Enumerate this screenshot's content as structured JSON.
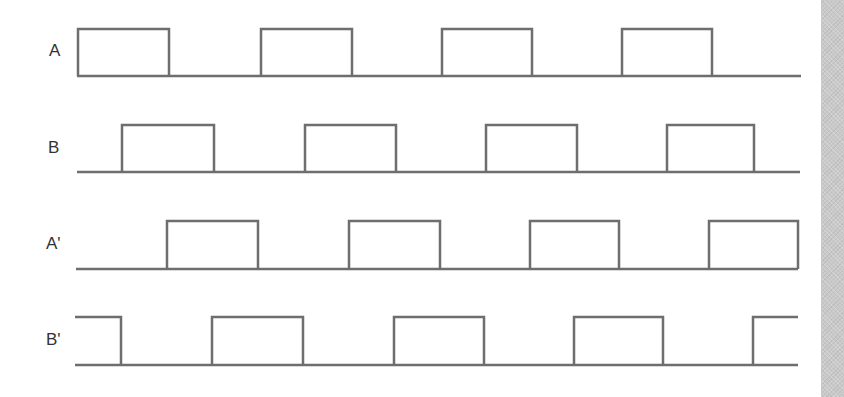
{
  "diagram": {
    "type": "timing-diagram",
    "stroke_color": "#6e6e6e",
    "stroke_width": 2.5,
    "background": "#ffffff",
    "side_bar_color": "#c9c9c9",
    "signals": [
      {
        "label": "A",
        "label_pos": [
          49,
          42
        ],
        "high_y": 29,
        "low_y": 76,
        "baseline": [
          77,
          801
        ],
        "pulses": [
          [
            78,
            169
          ],
          [
            261,
            352
          ],
          [
            442,
            532
          ],
          [
            622,
            712
          ]
        ],
        "starts_high": false,
        "ends_high": false
      },
      {
        "label": "B",
        "label_pos": [
          48,
          139
        ],
        "high_y": 125,
        "low_y": 172,
        "baseline": [
          77,
          800
        ],
        "pulses": [
          [
            122,
            214
          ],
          [
            305,
            396
          ],
          [
            486,
            577
          ],
          [
            667,
            754
          ]
        ],
        "starts_high": false,
        "ends_high": false
      },
      {
        "label": "A'",
        "label_pos": [
          46,
          235
        ],
        "high_y": 221,
        "low_y": 269,
        "baseline": [
          76,
          798
        ],
        "pulses": [
          [
            167,
            258
          ],
          [
            349,
            440
          ],
          [
            530,
            619
          ],
          [
            709,
            798
          ]
        ],
        "starts_high": false,
        "ends_high": false
      },
      {
        "label": "B'",
        "label_pos": [
          46,
          331
        ],
        "high_y": 317,
        "low_y": 365,
        "baseline": [
          75,
          798
        ],
        "pulses": [
          [
            75,
            121
          ],
          [
            212,
            303
          ],
          [
            394,
            484
          ],
          [
            574,
            663
          ],
          [
            753,
            798
          ]
        ],
        "starts_high": true,
        "ends_high": true
      }
    ]
  }
}
